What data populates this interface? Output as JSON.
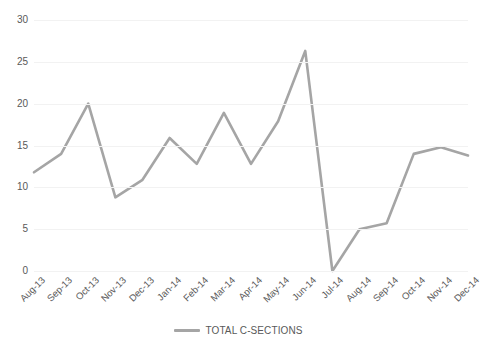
{
  "chart_data": {
    "type": "line",
    "title": "",
    "xlabel": "",
    "ylabel": "",
    "ylim": [
      0,
      30
    ],
    "ytick_step": 5,
    "yticks": [
      30,
      25,
      20,
      15,
      10,
      5,
      0
    ],
    "grid": true,
    "legend_position": "bottom",
    "line_color": "#a5a5a5",
    "categories": [
      "Aug-13",
      "Sep-13",
      "Oct-13",
      "Nov-13",
      "Dec-13",
      "Jan-14",
      "Feb-14",
      "Mar-14",
      "Apr-14",
      "May-14",
      "Jun-14",
      "Jul-14",
      "Aug-14",
      "Sep-14",
      "Oct-14",
      "Nov-14",
      "Dec-14"
    ],
    "series": [
      {
        "name": "TOTAL C-SECTIONS",
        "color": "#a5a5a5",
        "values": [
          11.8,
          14.0,
          20.0,
          8.8,
          10.9,
          15.9,
          12.8,
          18.9,
          12.8,
          17.9,
          26.3,
          0,
          5.0,
          5.7,
          14.0,
          14.8,
          13.8
        ]
      }
    ]
  },
  "legend": {
    "items": [
      {
        "label": "TOTAL C-SECTIONS",
        "color": "#a5a5a5"
      }
    ]
  },
  "axes": {
    "y_tick_labels": [
      "30",
      "25",
      "20",
      "15",
      "10",
      "5",
      "0"
    ],
    "x_tick_labels": [
      "Aug-13",
      "Sep-13",
      "Oct-13",
      "Nov-13",
      "Dec-13",
      "Jan-14",
      "Feb-14",
      "Mar-14",
      "Apr-14",
      "May-14",
      "Jun-14",
      "Jul-14",
      "Aug-14",
      "Sep-14",
      "Oct-14",
      "Nov-14",
      "Dec-14"
    ]
  }
}
